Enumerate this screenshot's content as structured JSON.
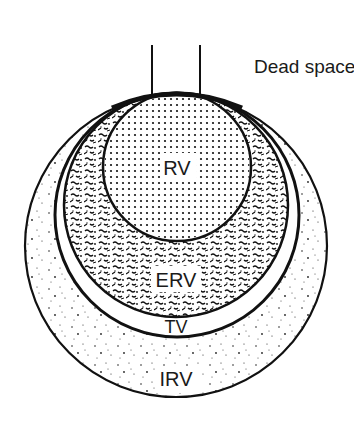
{
  "diagram": {
    "type": "nested-circles-lung-volumes",
    "labels": {
      "dead_space": "Dead space",
      "rv": "RV",
      "erv": "ERV",
      "tv": "TV",
      "irv": "IRV"
    },
    "regions": [
      {
        "id": "irv",
        "label": "IRV",
        "fill": "sparse-stipple"
      },
      {
        "id": "tv",
        "label": "TV",
        "fill": "white"
      },
      {
        "id": "erv",
        "label": "ERV",
        "fill": "dense-squiggle"
      },
      {
        "id": "rv",
        "label": "RV",
        "fill": "regular-dots"
      }
    ],
    "colors": {
      "stroke": "#111111",
      "background": "#ffffff"
    }
  }
}
